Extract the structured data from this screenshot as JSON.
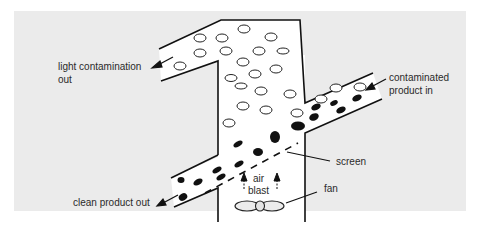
{
  "diagram": {
    "colors": {
      "panel_background": "#ebebeb",
      "page_background": "#ffffff",
      "channel_fill": "#ffffff",
      "stroke": "#111111",
      "label_text": "#2a2a2a"
    },
    "labels": {
      "light_out_line1": "light contamination",
      "light_out_line2": "out",
      "contaminated_in_line1": "contaminated",
      "contaminated_in_line2": "product in",
      "screen": "screen",
      "air_line1": "air",
      "air_line2": "blast",
      "fan": "fan",
      "clean_out": "clean product out"
    },
    "components": [
      {
        "name": "vertical-column",
        "description": "upright duct carrying light contamination upward"
      },
      {
        "name": "light-contamination-outlet",
        "description": "upper-left inclined outlet duct"
      },
      {
        "name": "contaminated-product-inlet",
        "description": "inclined inlet duct from right"
      },
      {
        "name": "screen",
        "description": "dashed inclined screen across column"
      },
      {
        "name": "clean-product-outlet",
        "description": "lower-left inclined outlet duct"
      },
      {
        "name": "fan",
        "description": "fan at bottom of column producing air blast"
      }
    ],
    "particles": {
      "light_contaminants": "open ellipses (hollow)",
      "product": "filled black ellipses"
    }
  }
}
